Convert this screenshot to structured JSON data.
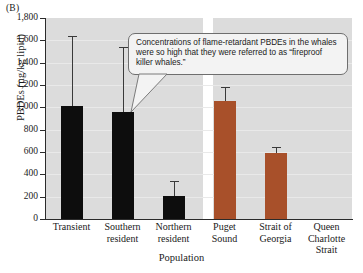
{
  "panel": {
    "label": "(B)"
  },
  "chart_data": {
    "type": "bar",
    "title": "",
    "xlabel": "Population",
    "ylabel": "PBDEs (µg/kg lipid)",
    "ylim": [
      0,
      1800
    ],
    "ytick_step": 200,
    "grid": true,
    "legend": "none",
    "categories": [
      "Transient",
      "Southern\nresident",
      "Northern\nresident",
      "Puget\nSound",
      "Strait of\nGeorgia",
      "Queen\nCharlotte\nStrait"
    ],
    "ytick_labels": [
      "1,800",
      "1,600",
      "1,400",
      "1,200",
      "1,000",
      "800",
      "600",
      "400",
      "200",
      "0"
    ],
    "ytick_values": [
      1800,
      1600,
      1400,
      1200,
      1000,
      800,
      600,
      400,
      200,
      0
    ],
    "values": [
      1010,
      955,
      210,
      1055,
      595,
      null
    ],
    "error_high": [
      1640,
      1540,
      340,
      1185,
      645,
      null
    ],
    "series": [
      {
        "name": "PBDE concentration",
        "points": [
          {
            "category": "Transient",
            "value": 1010,
            "error_high": 1640,
            "color": "#0d0d0d"
          },
          {
            "category": "Southern resident",
            "value": 955,
            "error_high": 1540,
            "color": "#0d0d0d"
          },
          {
            "category": "Northern resident",
            "value": 210,
            "error_high": 340,
            "color": "#0d0d0d"
          },
          {
            "category": "Puget Sound",
            "value": 1055,
            "error_high": 1185,
            "color": "#A8502A"
          },
          {
            "category": "Strait of Georgia",
            "value": 595,
            "error_high": 645,
            "color": "#A8502A"
          },
          {
            "category": "Queen Charlotte Strait",
            "value": null,
            "error_high": null,
            "color": "#A8502A"
          }
        ]
      }
    ],
    "annotations": [
      {
        "text": "Concentrations of flame-retardant PBDEs in the whales were so high that they were referred to as “fireproof killer whales.”",
        "points_to": "Southern resident"
      }
    ],
    "colors": {
      "black_bars": "#0d0d0d",
      "orange_bars": "#A8502A",
      "plot_background": "#dcdcdc",
      "axis": "#2b2b2b",
      "gridline": "#e9e9e9"
    }
  }
}
